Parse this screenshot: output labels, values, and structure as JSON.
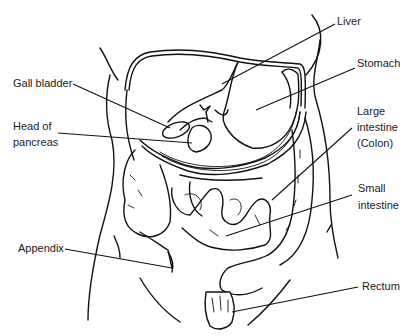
{
  "figure": {
    "background": "#ffffff",
    "line_color": "#111111"
  },
  "labels": {
    "liver": "Liver",
    "stomach": "Stomach",
    "large_intestine": [
      "Large",
      "intestine",
      "(Colon)"
    ],
    "gall_bladder": "Gall bladder",
    "head_of_pancreas": [
      "Head of",
      "pancreas"
    ],
    "small_intestine": [
      "Small",
      "intestine"
    ],
    "appendix": "Appendix",
    "rectum": "Rectum"
  }
}
